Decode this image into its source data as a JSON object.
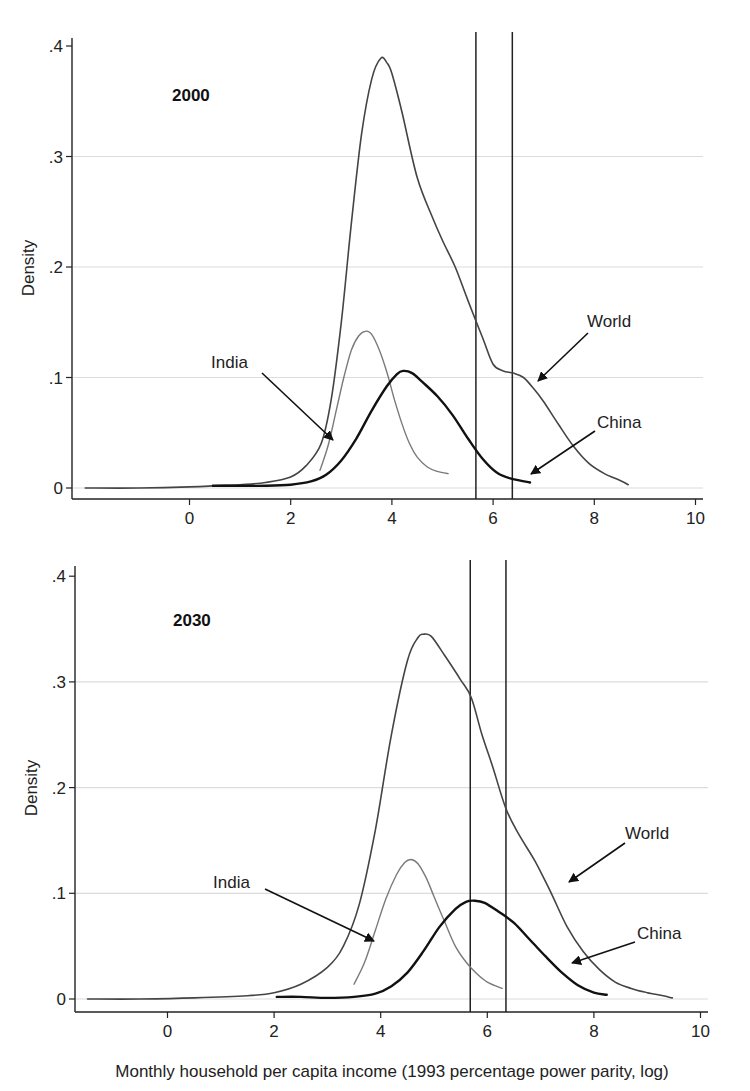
{
  "chart_data": [
    {
      "type": "line",
      "panel_label": "2000",
      "title": "2000",
      "xlabel": "",
      "ylabel": "Density",
      "xlim": [
        -2.3,
        10.2
      ],
      "ylim": [
        0,
        0.4
      ],
      "xticks": [
        0,
        2,
        4,
        6,
        8,
        10
      ],
      "xtick_labels": [
        "0",
        "2",
        "4",
        "6",
        "8",
        "10"
      ],
      "yticks": [
        0,
        0.1,
        0.2,
        0.3,
        0.4
      ],
      "ytick_labels": [
        "0",
        ".1",
        ".2",
        ".3",
        ".4"
      ],
      "grid": "horizontal",
      "legend": "none (arrow annotations)",
      "reference_lines_x": [
        5.66,
        6.38
      ],
      "series": [
        {
          "name": "World",
          "color": "#444444",
          "width": 1.6,
          "x": [
            -2.06,
            -1,
            0,
            0.5,
            1,
            1.5,
            2,
            2.3,
            2.6,
            2.8,
            3.0,
            3.2,
            3.4,
            3.6,
            3.78,
            3.9,
            4.0,
            4.2,
            4.5,
            4.8,
            5.0,
            5.25,
            5.5,
            5.8,
            6.0,
            6.2,
            6.4,
            6.6,
            6.8,
            7.0,
            7.3,
            7.6,
            7.9,
            8.2,
            8.5,
            8.67
          ],
          "y": [
            0.0,
            0.0,
            0.001,
            0.002,
            0.003,
            0.005,
            0.01,
            0.02,
            0.04,
            0.08,
            0.15,
            0.24,
            0.32,
            0.37,
            0.389,
            0.385,
            0.375,
            0.34,
            0.281,
            0.245,
            0.224,
            0.2,
            0.17,
            0.135,
            0.112,
            0.106,
            0.104,
            0.1,
            0.09,
            0.078,
            0.057,
            0.037,
            0.022,
            0.013,
            0.007,
            0.003
          ]
        },
        {
          "name": "India",
          "color": "#7a7a7a",
          "width": 1.4,
          "x": [
            2.58,
            2.75,
            2.9,
            3.05,
            3.2,
            3.35,
            3.49,
            3.6,
            3.75,
            3.9,
            4.05,
            4.2,
            4.35,
            4.5,
            4.7,
            4.9,
            5.11
          ],
          "y": [
            0.016,
            0.04,
            0.07,
            0.1,
            0.125,
            0.138,
            0.142,
            0.139,
            0.125,
            0.105,
            0.08,
            0.058,
            0.04,
            0.028,
            0.019,
            0.015,
            0.013
          ]
        },
        {
          "name": "China",
          "color": "#111111",
          "width": 2.4,
          "x": [
            0.46,
            1.0,
            1.5,
            2.0,
            2.4,
            2.7,
            3.0,
            3.3,
            3.6,
            3.9,
            4.1,
            4.22,
            4.4,
            4.6,
            4.9,
            5.2,
            5.5,
            5.8,
            6.1,
            6.4,
            6.73
          ],
          "y": [
            0.002,
            0.002,
            0.002,
            0.003,
            0.006,
            0.012,
            0.025,
            0.045,
            0.07,
            0.092,
            0.103,
            0.106,
            0.104,
            0.096,
            0.083,
            0.066,
            0.045,
            0.026,
            0.013,
            0.008,
            0.005
          ]
        }
      ],
      "annotations": [
        {
          "text": "India",
          "x_px": 211,
          "y_px": 368,
          "arrow_from": [
            262,
            373
          ],
          "arrow_to": [
            333,
            440
          ]
        },
        {
          "text": "World",
          "x_px": 587,
          "y_px": 327,
          "arrow_from": [
            588,
            333
          ],
          "arrow_to": [
            538,
            381
          ]
        },
        {
          "text": "China",
          "x_px": 597,
          "y_px": 428,
          "arrow_from": [
            595,
            431
          ],
          "arrow_to": [
            531,
            474
          ]
        }
      ]
    },
    {
      "type": "line",
      "panel_label": "2030",
      "title": "2030",
      "xlabel": "Monthly household per capita income (1993 percentage power parity, log)",
      "ylabel": "Density",
      "xlim": [
        -1.7,
        10.2
      ],
      "ylim": [
        0,
        0.4
      ],
      "xticks": [
        0,
        2,
        4,
        6,
        8,
        10
      ],
      "xtick_labels": [
        "0",
        "2",
        "4",
        "6",
        "8",
        "10"
      ],
      "yticks": [
        0,
        0.1,
        0.2,
        0.3,
        0.4
      ],
      "ytick_labels": [
        "0",
        ".1",
        ".2",
        ".3",
        ".4"
      ],
      "grid": "horizontal",
      "legend": "none (arrow annotations)",
      "reference_lines_x": [
        5.68,
        6.35
      ],
      "series": [
        {
          "name": "World",
          "color": "#444444",
          "width": 1.6,
          "x": [
            -1.5,
            -0.5,
            0.5,
            1.5,
            2.0,
            2.5,
            3.0,
            3.3,
            3.6,
            3.9,
            4.2,
            4.5,
            4.7,
            4.8,
            4.95,
            5.2,
            5.5,
            5.7,
            5.9,
            6.1,
            6.35,
            6.6,
            6.9,
            7.2,
            7.5,
            7.8,
            8.1,
            8.4,
            8.7,
            9.0,
            9.3,
            9.47
          ],
          "y": [
            0.0,
            0.0,
            0.001,
            0.003,
            0.006,
            0.014,
            0.03,
            0.05,
            0.09,
            0.16,
            0.25,
            0.32,
            0.342,
            0.345,
            0.343,
            0.325,
            0.302,
            0.285,
            0.25,
            0.22,
            0.18,
            0.155,
            0.13,
            0.1,
            0.068,
            0.045,
            0.028,
            0.016,
            0.01,
            0.006,
            0.003,
            0.001
          ]
        },
        {
          "name": "India",
          "color": "#7a7a7a",
          "width": 1.4,
          "x": [
            3.5,
            3.7,
            3.9,
            4.1,
            4.3,
            4.45,
            4.57,
            4.7,
            4.85,
            5.0,
            5.2,
            5.4,
            5.6,
            5.8,
            6.0,
            6.28
          ],
          "y": [
            0.014,
            0.035,
            0.065,
            0.095,
            0.118,
            0.129,
            0.132,
            0.128,
            0.115,
            0.097,
            0.073,
            0.05,
            0.035,
            0.024,
            0.016,
            0.01
          ]
        },
        {
          "name": "China",
          "color": "#111111",
          "width": 2.4,
          "x": [
            2.05,
            2.5,
            3.0,
            3.5,
            3.9,
            4.2,
            4.5,
            4.8,
            5.1,
            5.4,
            5.6,
            5.77,
            5.95,
            6.2,
            6.5,
            6.8,
            7.1,
            7.4,
            7.7,
            8.0,
            8.24
          ],
          "y": [
            0.002,
            0.002,
            0.001,
            0.002,
            0.005,
            0.012,
            0.025,
            0.045,
            0.068,
            0.085,
            0.092,
            0.093,
            0.091,
            0.083,
            0.072,
            0.056,
            0.04,
            0.025,
            0.013,
            0.006,
            0.004
          ]
        }
      ],
      "annotations": [
        {
          "text": "India",
          "x_px": 213,
          "y_px": 888,
          "arrow_from": [
            265,
            889
          ],
          "arrow_to": [
            374,
            941
          ]
        },
        {
          "text": "World",
          "x_px": 625,
          "y_px": 839,
          "arrow_from": [
            625,
            843
          ],
          "arrow_to": [
            569,
            882
          ]
        },
        {
          "text": "China",
          "x_px": 637,
          "y_px": 939,
          "arrow_from": [
            635,
            942
          ],
          "arrow_to": [
            572,
            963
          ]
        }
      ]
    }
  ],
  "panels": [
    {
      "layout": {
        "x0_px": 189.5,
        "px_per_unit": 50.6,
        "y0_px": 488,
        "px_per_tenth": 110.5,
        "axis_left_px": 72,
        "axis_right_px": 703,
        "axis_top_px": 38,
        "axis_bottom_px": 499,
        "ylabel_x_px": 34,
        "ylabel_y_px": 268,
        "title_x_px": 172,
        "title_y_px": 101
      }
    },
    {
      "layout": {
        "x0_px": 167.5,
        "px_per_unit": 53.3,
        "y0_px": 999,
        "px_per_tenth": 105.7,
        "axis_left_px": 75,
        "axis_right_px": 708,
        "axis_top_px": 566,
        "axis_bottom_px": 1012,
        "ylabel_x_px": 37,
        "ylabel_y_px": 788,
        "title_x_px": 173,
        "title_y_px": 626
      }
    }
  ],
  "xlabel_bottom": {
    "text": "Monthly household per capita income (1993 percentage power parity, log)",
    "x_px": 392,
    "y_px": 1077
  },
  "colors": {
    "grid": "#dcdcdc",
    "axis": "#222222",
    "refline": "#222222"
  }
}
